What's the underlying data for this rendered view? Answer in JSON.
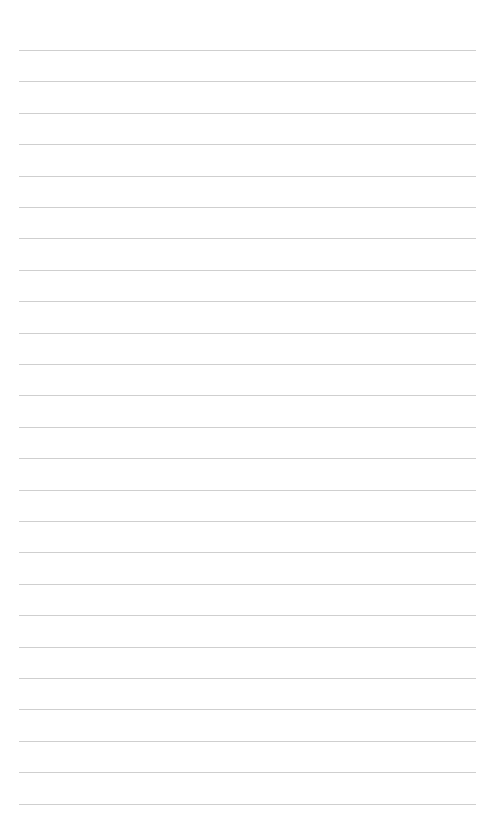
{
  "page": {
    "type": "lined-paper",
    "background_color": "#ffffff",
    "line_color": "#cfcfcf",
    "line_count": 25,
    "first_line_y": 50,
    "line_spacing": 31.4,
    "line_left": 19,
    "line_right": 476,
    "text": []
  }
}
